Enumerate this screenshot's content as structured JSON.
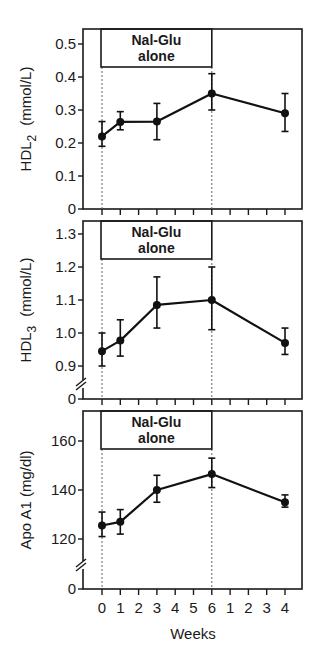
{
  "chart_data": [
    {
      "type": "line",
      "panel": "HDL2",
      "title": "",
      "ylabel": "HDL2 (mmol/L)",
      "ylabel_main": "HDL",
      "ylabel_sub": "2",
      "ylabel_unit": "(mmol/L)",
      "xlabel": "Weeks",
      "annotation": [
        "Nal-Glu",
        "alone"
      ],
      "ylim": [
        0,
        0.55
      ],
      "yticks": [
        "0",
        "0.1",
        "0.2",
        "0.3",
        "0.4",
        "0.5"
      ],
      "x_positions": [
        0,
        1,
        3,
        6,
        10
      ],
      "x_labels": [
        "0",
        "1",
        "3",
        "6",
        "4"
      ],
      "values": [
        0.22,
        0.264,
        0.265,
        0.35,
        0.29
      ],
      "error_high": [
        0.265,
        0.295,
        0.32,
        0.41,
        0.35
      ],
      "error_low": [
        0.19,
        0.24,
        0.21,
        0.3,
        0.235
      ],
      "axis_break": false
    },
    {
      "type": "line",
      "panel": "HDL3",
      "title": "",
      "ylabel": "HDL3 (mmol/L)",
      "ylabel_main": "HDL",
      "ylabel_sub": "3",
      "ylabel_unit": "(mmol/L)",
      "xlabel": "Weeks",
      "annotation": [
        "Nal-Glu",
        "alone"
      ],
      "ylim": [
        0.85,
        1.35
      ],
      "yticks": [
        "0",
        "0.9",
        "1.0",
        "1.1",
        "1.2",
        "1.3"
      ],
      "x_positions": [
        0,
        1,
        3,
        6,
        10
      ],
      "x_labels": [
        "0",
        "1",
        "3",
        "6",
        "4"
      ],
      "values": [
        0.945,
        0.977,
        1.085,
        1.1,
        0.97
      ],
      "error_high": [
        1.0,
        1.04,
        1.17,
        1.2,
        1.015
      ],
      "error_low": [
        0.9,
        0.93,
        1.015,
        1.01,
        0.935
      ],
      "axis_break": true
    },
    {
      "type": "line",
      "panel": "Apo A1",
      "title": "",
      "ylabel": "Apo A1 (mg/dl)",
      "ylabel_main": "Apo A1 (mg/dl)",
      "xlabel": "Weeks",
      "annotation": [
        "Nal-Glu",
        "alone"
      ],
      "ylim": [
        110,
        172
      ],
      "yticks": [
        "0",
        "120",
        "140",
        "160"
      ],
      "x_positions": [
        0,
        1,
        3,
        6,
        10
      ],
      "x_labels": [
        "0",
        "1",
        "3",
        "6",
        "4"
      ],
      "values": [
        125.5,
        127,
        140,
        146.5,
        135
      ],
      "error_high": [
        131,
        132,
        146,
        153,
        138
      ],
      "error_low": [
        121,
        122,
        135,
        141,
        133
      ],
      "axis_break": true
    }
  ],
  "x_axis": {
    "tick_labels": [
      "0",
      "1",
      "2",
      "3",
      "4",
      "5",
      "6",
      "1",
      "2",
      "3",
      "4"
    ],
    "title": "Weeks"
  }
}
